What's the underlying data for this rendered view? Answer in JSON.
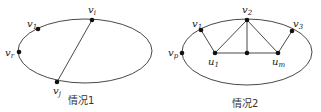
{
  "figures": [
    {
      "caption": "情况1",
      "ellipse": {
        "cx": 85,
        "cy": 51,
        "rx": 67,
        "ry": 32
      },
      "vertices": [
        {
          "id": "vi",
          "base": "v",
          "sub": "i",
          "x": 92,
          "y": 20,
          "lx": 88,
          "ly": 13
        },
        {
          "id": "v1",
          "base": "v",
          "sub": "1",
          "x": 38,
          "y": 29,
          "lx": 27,
          "ly": 27
        },
        {
          "id": "vr",
          "base": "v",
          "sub": "r",
          "x": 19,
          "y": 52,
          "lx": 5,
          "ly": 56
        },
        {
          "id": "vj",
          "base": "v",
          "sub": "j",
          "x": 57,
          "y": 82,
          "lx": 53,
          "ly": 94
        }
      ],
      "edges": [
        [
          "vi",
          "vj"
        ]
      ]
    },
    {
      "caption": "情况2",
      "ellipse": {
        "cx": 247,
        "cy": 52,
        "rx": 65,
        "ry": 33
      },
      "vertices": [
        {
          "id": "v2",
          "base": "v",
          "sub": "2",
          "x": 247,
          "y": 20,
          "lx": 242,
          "ly": 13
        },
        {
          "id": "v1",
          "base": "v",
          "sub": "1",
          "x": 201,
          "y": 30,
          "lx": 192,
          "ly": 27
        },
        {
          "id": "v3",
          "base": "v",
          "sub": "3",
          "x": 292,
          "y": 31,
          "lx": 293,
          "ly": 27
        },
        {
          "id": "vp",
          "base": "v",
          "sub": "p",
          "x": 182,
          "y": 53,
          "lx": 168,
          "ly": 56
        },
        {
          "id": "u1",
          "base": "u",
          "sub": "1",
          "x": 215,
          "y": 53,
          "lx": 208,
          "ly": 65
        },
        {
          "id": "mid",
          "base": "",
          "sub": "",
          "x": 247,
          "y": 53,
          "lx": 0,
          "ly": 0
        },
        {
          "id": "um",
          "base": "u",
          "sub": "m",
          "x": 278,
          "y": 53,
          "lx": 272,
          "ly": 65
        }
      ],
      "edges": [
        [
          "v1",
          "u1"
        ],
        [
          "u1",
          "v2"
        ],
        [
          "v2",
          "mid"
        ],
        [
          "v2",
          "um"
        ],
        [
          "um",
          "v3"
        ],
        [
          "u1",
          "um"
        ]
      ]
    }
  ],
  "captions": {
    "left": "情况1",
    "right": "情况2"
  },
  "colors": {
    "stroke": "#333333",
    "vertex": "#111111"
  }
}
